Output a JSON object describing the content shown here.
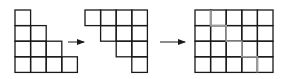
{
  "diagram": {
    "colors": {
      "line": "#1a1a1a",
      "inner_light": "#9a9a9a",
      "background": "#ffffff"
    },
    "cell_size": 15.6,
    "figures": [
      {
        "id": "staircase-left",
        "origin": [
          15,
          10
        ],
        "rows": [
          [
            0
          ],
          [
            0,
            1
          ],
          [
            0,
            1,
            2
          ],
          [
            0,
            1,
            2,
            3
          ]
        ]
      },
      {
        "id": "staircase-right-rotated",
        "origin": [
          85,
          10
        ],
        "rows": [
          [
            0,
            1,
            2,
            3
          ],
          [
            1,
            2,
            3
          ],
          [
            2,
            3
          ],
          [
            3
          ]
        ]
      },
      {
        "id": "combined-rectangle",
        "origin": [
          195,
          10
        ],
        "cols": 5,
        "rows_count": 4
      }
    ],
    "arrows": [
      {
        "id": "arrow-1",
        "from": [
          68,
          42
        ],
        "to": [
          84,
          42
        ]
      },
      {
        "id": "arrow-2",
        "from": [
          160,
          42
        ],
        "to": [
          185,
          42
        ]
      }
    ]
  }
}
